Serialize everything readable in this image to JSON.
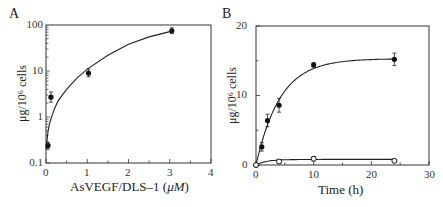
{
  "figure": {
    "panels": [
      {
        "id": "A",
        "label": "A"
      },
      {
        "id": "B",
        "label": "B"
      }
    ]
  },
  "chart_data": [
    {
      "panel": "A",
      "type": "scatter",
      "title": "",
      "xlabel": "AsVEGF/DLS–1 (μM)",
      "xlabel_plain": "AsVEGF/DLS–1 (",
      "xlabel_unit": "μM",
      "xlabel_close": ")",
      "ylabel": "μg/10⁶ cells",
      "xlim": [
        0,
        4
      ],
      "ylim": [
        0.1,
        100
      ],
      "yscale": "log",
      "xticks": [
        0,
        1,
        2,
        3,
        4
      ],
      "xtick_labels": [
        "0",
        "1",
        "2",
        "3",
        "4"
      ],
      "yticks": [
        100,
        10,
        1,
        0.1
      ],
      "ytick_labels": [
        "100",
        "10",
        "1",
        "0.1"
      ],
      "grid": false,
      "legend": null,
      "series": [
        {
          "name": "uptake",
          "marker": "filled-circle",
          "x": [
            0.05,
            0.12,
            1.03,
            3.05
          ],
          "y": [
            0.24,
            2.7,
            9.0,
            75
          ],
          "yerr_low": [
            0.04,
            0.6,
            1.5,
            10
          ],
          "yerr_high": [
            0.04,
            0.8,
            2.0,
            12
          ]
        }
      ],
      "fit_curve": {
        "type": "saturation",
        "x": [
          0,
          0.05,
          0.1,
          0.2,
          0.3,
          0.5,
          0.75,
          1.0,
          1.5,
          2.0,
          2.5,
          3.0
        ],
        "y": [
          0.2,
          0.5,
          0.8,
          1.5,
          2.3,
          4.0,
          7.0,
          11,
          22,
          38,
          55,
          72
        ]
      }
    },
    {
      "panel": "B",
      "type": "line",
      "title": "",
      "xlabel": "Time (h)",
      "ylabel": "μg/10⁶ cells",
      "xlim": [
        0,
        30
      ],
      "ylim": [
        0,
        20
      ],
      "xticks": [
        0,
        10,
        20,
        30
      ],
      "xtick_labels": [
        "0",
        "10",
        "20",
        "30"
      ],
      "yticks": [
        0,
        10,
        20
      ],
      "ytick_labels": [
        "0",
        "10",
        "20"
      ],
      "grid": false,
      "legend": null,
      "series": [
        {
          "name": "filled",
          "marker": "filled-circle",
          "x": [
            0,
            1,
            2,
            4,
            10,
            24
          ],
          "y": [
            0,
            2.6,
            6.4,
            8.6,
            14.4,
            15.2
          ],
          "yerr": [
            0,
            0.6,
            0.9,
            1.0,
            0.3,
            0.9
          ]
        },
        {
          "name": "open",
          "marker": "open-circle",
          "x": [
            0,
            4,
            10,
            24
          ],
          "y": [
            0,
            0.5,
            0.9,
            0.6
          ],
          "yerr": [
            0,
            0.2,
            0.3,
            0.2
          ]
        }
      ],
      "fit_curves": [
        {
          "series": "filled",
          "model": "15.3*(1-exp(-x/4.2))"
        },
        {
          "series": "open",
          "model": "0.8*(1-exp(-x/1.8))"
        }
      ]
    }
  ]
}
